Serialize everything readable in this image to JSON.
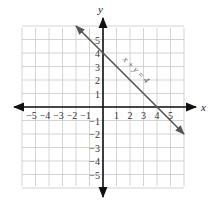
{
  "chart_data": {
    "type": "line",
    "title": "",
    "xlabel": "x",
    "ylabel": "y",
    "xlim": [
      -6,
      6
    ],
    "ylim": [
      -6,
      6
    ],
    "grid": true,
    "x_ticks": [
      "-5",
      "-4",
      "-3",
      "-2",
      "-1",
      "1",
      "2",
      "3",
      "4",
      "5"
    ],
    "y_ticks": [
      "5",
      "4",
      "3",
      "2",
      "1",
      "-1",
      "-2",
      "-3",
      "-4",
      "-5"
    ],
    "series": [
      {
        "name": "x + y = 4",
        "equation": "x + y = 4",
        "x": [
          -2,
          0,
          4,
          6
        ],
        "y": [
          6,
          4,
          0,
          -2
        ],
        "arrows": "both"
      }
    ],
    "annotations": [
      {
        "text": "x + y = 4",
        "x": 2.3,
        "y": 2.6,
        "rotation": -45
      }
    ]
  },
  "colors": {
    "grid": "#c8c8c8",
    "axis": "#111111",
    "line": "#555555"
  }
}
